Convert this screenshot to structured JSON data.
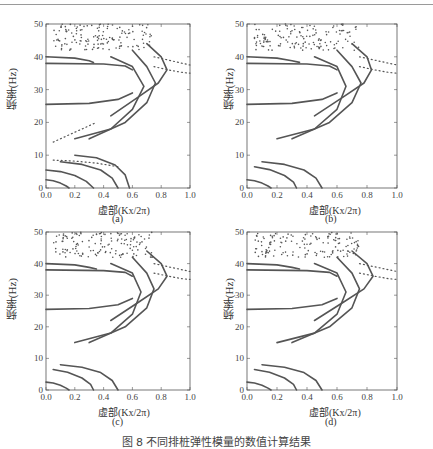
{
  "figure": {
    "caption": "图 8  不同排桩弹性模量的数值计算结果",
    "panels": [
      {
        "id": "a",
        "label": "(a)",
        "xlabel": "虚部(Kx/2π)",
        "ylabel": "频率(Hz)"
      },
      {
        "id": "b",
        "label": "(b)",
        "xlabel": "虚部(Kx/2π)",
        "ylabel": "频率(Hz)"
      },
      {
        "id": "c",
        "label": "(c)",
        "xlabel": "虚部(Kx/2π)",
        "ylabel": "频率(Hz)"
      },
      {
        "id": "d",
        "label": "(d)",
        "xlabel": "虚部(Kx/2π)",
        "ylabel": "频率(Hz)"
      }
    ]
  },
  "chart_data": [
    {
      "type": "scatter",
      "title": "(a)",
      "xlabel": "虚部(Kx/2π)",
      "ylabel": "频率(Hz)",
      "xlim": [
        0,
        1.0
      ],
      "ylim": [
        0,
        50
      ],
      "xticks": [
        0.0,
        0.2,
        0.4,
        0.6,
        0.8,
        1.0
      ],
      "yticks": [
        0,
        10,
        20,
        30,
        40,
        50
      ],
      "grid": false,
      "legend": null,
      "series": [
        {
          "name": "band-0-low-1",
          "x": [
            0.0,
            0.05,
            0.1,
            0.14,
            0.16
          ],
          "y": [
            2.5,
            2.2,
            1.5,
            0.6,
            0
          ]
        },
        {
          "name": "band-0-low-2",
          "x": [
            0.0,
            0.1,
            0.2,
            0.28,
            0.33
          ],
          "y": [
            5.5,
            5.0,
            3.8,
            2.0,
            0
          ]
        },
        {
          "name": "band-0-low-3",
          "x": [
            0.1,
            0.25,
            0.38,
            0.46,
            0.5
          ],
          "y": [
            8,
            7.2,
            5.5,
            3.0,
            0
          ]
        },
        {
          "name": "band-0-low-4",
          "x": [
            0.2,
            0.35,
            0.48,
            0.55,
            0.58
          ],
          "y": [
            10,
            9.2,
            7.0,
            4.0,
            0
          ]
        },
        {
          "name": "dotted-8Hz",
          "x": [
            0.05,
            0.2,
            0.35,
            0.5
          ],
          "y": [
            8.5,
            8.2,
            7.6,
            6.5
          ]
        },
        {
          "name": "band-flat-25.5",
          "x": [
            0.0,
            0.3,
            0.5,
            0.6
          ],
          "y": [
            25.5,
            25.8,
            27,
            29
          ]
        },
        {
          "name": "band-flat-38",
          "x": [
            0.0,
            0.4,
            0.55,
            0.6
          ],
          "y": [
            38,
            37.8,
            37.2,
            36
          ]
        },
        {
          "name": "band-flat-40",
          "x": [
            0.0,
            0.2,
            0.3,
            0.33
          ],
          "y": [
            40,
            39.6,
            38.8,
            38.3
          ]
        },
        {
          "name": "loop-1",
          "x": [
            0.2,
            0.45,
            0.6,
            0.68,
            0.6,
            0.45
          ],
          "y": [
            15,
            18,
            24,
            31,
            37,
            40
          ]
        },
        {
          "name": "loop-2",
          "x": [
            0.3,
            0.55,
            0.7,
            0.76,
            0.7,
            0.6
          ],
          "y": [
            15,
            20,
            26,
            32,
            37,
            42
          ]
        },
        {
          "name": "loop-3",
          "x": [
            0.45,
            0.65,
            0.78,
            0.84,
            0.8,
            0.7
          ],
          "y": [
            22,
            28,
            32,
            36,
            40,
            44
          ]
        },
        {
          "name": "dotted-high-1",
          "x": [
            0.75,
            0.85,
            0.95,
            1.0
          ],
          "y": [
            40,
            39,
            38,
            37.5
          ]
        },
        {
          "name": "dotted-high-2",
          "x": [
            0.75,
            0.85,
            0.95,
            1.0
          ],
          "y": [
            37,
            36,
            35.2,
            35
          ]
        },
        {
          "name": "dotted-mid",
          "x": [
            0.05,
            0.15,
            0.25,
            0.35
          ],
          "y": [
            14,
            16,
            18,
            20
          ]
        },
        {
          "name": "scatter-cloud-top",
          "x_range": [
            0.05,
            0.75
          ],
          "y_range": [
            42,
            50
          ]
        }
      ]
    },
    {
      "type": "scatter",
      "title": "(b)",
      "xlabel": "虚部(Kx/2π)",
      "ylabel": "频率(Hz)",
      "xlim": [
        0,
        1.0
      ],
      "ylim": [
        0,
        50
      ],
      "xticks": [
        0.0,
        0.2,
        0.4,
        0.6,
        0.8,
        1.0
      ],
      "yticks": [
        0,
        10,
        20,
        30,
        40,
        50
      ],
      "grid": false,
      "legend": null,
      "series": [
        {
          "name": "band-0-low-1",
          "x": [
            0.0,
            0.05,
            0.1,
            0.14,
            0.16
          ],
          "y": [
            2.5,
            2.2,
            1.5,
            0.6,
            0
          ]
        },
        {
          "name": "band-0-low-2",
          "x": [
            0.05,
            0.15,
            0.25,
            0.31,
            0.33
          ],
          "y": [
            6.5,
            5.6,
            3.8,
            1.8,
            0
          ]
        },
        {
          "name": "band-0-low-3",
          "x": [
            0.1,
            0.25,
            0.38,
            0.46,
            0.5
          ],
          "y": [
            8,
            7.2,
            5.5,
            3.0,
            0
          ]
        },
        {
          "name": "band-flat-25.5",
          "x": [
            0.0,
            0.3,
            0.5,
            0.6
          ],
          "y": [
            25.5,
            25.8,
            27,
            29
          ]
        },
        {
          "name": "band-flat-38",
          "x": [
            0.0,
            0.4,
            0.55,
            0.6
          ],
          "y": [
            38,
            37.8,
            37.2,
            36
          ]
        },
        {
          "name": "band-flat-40",
          "x": [
            0.0,
            0.2,
            0.3,
            0.35
          ],
          "y": [
            40,
            39.6,
            38.8,
            38.3
          ]
        },
        {
          "name": "loop-1",
          "x": [
            0.2,
            0.45,
            0.6,
            0.66,
            0.6,
            0.45
          ],
          "y": [
            15,
            18,
            24,
            31,
            37,
            40
          ]
        },
        {
          "name": "loop-2",
          "x": [
            0.3,
            0.55,
            0.7,
            0.76,
            0.7,
            0.6
          ],
          "y": [
            15,
            20,
            26,
            32,
            37,
            42
          ]
        },
        {
          "name": "loop-3",
          "x": [
            0.45,
            0.65,
            0.78,
            0.83,
            0.8,
            0.7
          ],
          "y": [
            22,
            28,
            32,
            36,
            40,
            44
          ]
        },
        {
          "name": "dotted-high-1",
          "x": [
            0.75,
            0.85,
            0.95,
            1.0
          ],
          "y": [
            40,
            39,
            38,
            37.5
          ]
        },
        {
          "name": "dotted-high-2",
          "x": [
            0.75,
            0.85,
            0.95,
            1.0
          ],
          "y": [
            37,
            36,
            35.2,
            35
          ]
        },
        {
          "name": "scatter-cloud-top",
          "x_range": [
            0.05,
            0.75
          ],
          "y_range": [
            42,
            50
          ]
        }
      ]
    },
    {
      "type": "scatter",
      "title": "(c)",
      "xlabel": "虚部(Kx/2π)",
      "ylabel": "频率(Hz)",
      "xlim": [
        0,
        1.0
      ],
      "ylim": [
        0,
        50
      ],
      "xticks": [
        0.0,
        0.2,
        0.4,
        0.6,
        0.8,
        1.0
      ],
      "yticks": [
        0,
        10,
        20,
        30,
        40,
        50
      ],
      "grid": false,
      "legend": null,
      "series": [
        {
          "name": "band-0-low-1",
          "x": [
            0.0,
            0.05,
            0.1,
            0.14,
            0.16
          ],
          "y": [
            2.5,
            2.2,
            1.5,
            0.6,
            0
          ]
        },
        {
          "name": "band-0-low-2",
          "x": [
            0.05,
            0.15,
            0.25,
            0.31,
            0.33
          ],
          "y": [
            6.5,
            5.6,
            3.8,
            1.8,
            0
          ]
        },
        {
          "name": "band-0-low-3",
          "x": [
            0.1,
            0.25,
            0.38,
            0.46,
            0.5
          ],
          "y": [
            8,
            7.2,
            5.5,
            3.0,
            0
          ]
        },
        {
          "name": "band-flat-25.5",
          "x": [
            0.0,
            0.3,
            0.5,
            0.6
          ],
          "y": [
            25.5,
            25.8,
            27,
            29
          ]
        },
        {
          "name": "band-flat-38",
          "x": [
            0.0,
            0.4,
            0.55,
            0.6
          ],
          "y": [
            38,
            37.8,
            37.2,
            36
          ]
        },
        {
          "name": "band-flat-40",
          "x": [
            0.0,
            0.2,
            0.3,
            0.35
          ],
          "y": [
            40,
            39.6,
            38.8,
            38.3
          ]
        },
        {
          "name": "loop-1",
          "x": [
            0.2,
            0.45,
            0.6,
            0.66,
            0.6,
            0.45
          ],
          "y": [
            15,
            18,
            24,
            31,
            37,
            40
          ]
        },
        {
          "name": "loop-2",
          "x": [
            0.3,
            0.55,
            0.7,
            0.75,
            0.7,
            0.6
          ],
          "y": [
            15,
            20,
            26,
            32,
            37,
            42
          ]
        },
        {
          "name": "loop-3",
          "x": [
            0.45,
            0.65,
            0.78,
            0.84,
            0.8,
            0.7
          ],
          "y": [
            22,
            28,
            32,
            36,
            40,
            44
          ]
        },
        {
          "name": "dotted-high-1",
          "x": [
            0.75,
            0.85,
            0.95,
            1.0
          ],
          "y": [
            40,
            39,
            38,
            37.5
          ]
        },
        {
          "name": "dotted-high-2",
          "x": [
            0.75,
            0.85,
            0.95,
            1.0
          ],
          "y": [
            37,
            36,
            35.2,
            35
          ]
        },
        {
          "name": "scatter-cloud-top",
          "x_range": [
            0.05,
            0.75
          ],
          "y_range": [
            42,
            50
          ]
        }
      ]
    },
    {
      "type": "scatter",
      "title": "(d)",
      "xlabel": "虚部(Kx/2π)",
      "ylabel": "频率(Hz)",
      "xlim": [
        0,
        1.0
      ],
      "ylim": [
        0,
        50
      ],
      "xticks": [
        0.0,
        0.2,
        0.4,
        0.6,
        0.8,
        1.0
      ],
      "yticks": [
        0,
        10,
        20,
        30,
        40,
        50
      ],
      "grid": false,
      "legend": null,
      "series": [
        {
          "name": "band-0-low-1",
          "x": [
            0.0,
            0.05,
            0.1,
            0.14,
            0.16
          ],
          "y": [
            2.5,
            2.2,
            1.5,
            0.6,
            0
          ]
        },
        {
          "name": "band-0-low-2",
          "x": [
            0.05,
            0.15,
            0.25,
            0.31,
            0.33
          ],
          "y": [
            6.5,
            5.6,
            3.8,
            1.8,
            0
          ]
        },
        {
          "name": "band-0-low-3",
          "x": [
            0.1,
            0.25,
            0.38,
            0.46,
            0.5
          ],
          "y": [
            8,
            7.2,
            5.5,
            3.0,
            0
          ]
        },
        {
          "name": "band-flat-25.5",
          "x": [
            0.0,
            0.3,
            0.5,
            0.6
          ],
          "y": [
            25.5,
            25.8,
            27,
            29
          ]
        },
        {
          "name": "band-flat-38",
          "x": [
            0.0,
            0.4,
            0.55,
            0.6
          ],
          "y": [
            38,
            37.8,
            37.2,
            36
          ]
        },
        {
          "name": "band-flat-40",
          "x": [
            0.0,
            0.2,
            0.3,
            0.35
          ],
          "y": [
            40,
            39.6,
            38.8,
            38.3
          ]
        },
        {
          "name": "loop-1",
          "x": [
            0.2,
            0.45,
            0.6,
            0.66,
            0.6,
            0.45
          ],
          "y": [
            15,
            18,
            24,
            31,
            37,
            40
          ]
        },
        {
          "name": "loop-2",
          "x": [
            0.3,
            0.55,
            0.7,
            0.75,
            0.7,
            0.6
          ],
          "y": [
            15,
            20,
            26,
            32,
            37,
            42
          ]
        },
        {
          "name": "loop-3",
          "x": [
            0.45,
            0.65,
            0.78,
            0.84,
            0.8,
            0.7
          ],
          "y": [
            22,
            28,
            32,
            36,
            40,
            44
          ]
        },
        {
          "name": "dotted-high-1",
          "x": [
            0.75,
            0.85,
            0.95,
            1.0
          ],
          "y": [
            40,
            39,
            38,
            37.5
          ]
        },
        {
          "name": "dotted-high-2",
          "x": [
            0.75,
            0.85,
            0.95,
            1.0
          ],
          "y": [
            37,
            36,
            35.2,
            35
          ]
        },
        {
          "name": "scatter-cloud-top",
          "x_range": [
            0.05,
            0.75
          ],
          "y_range": [
            42,
            50
          ]
        }
      ]
    }
  ],
  "style": {
    "curve_color": "#555555",
    "axis_color": "#555555",
    "rule_color": "#9a9a9a"
  }
}
